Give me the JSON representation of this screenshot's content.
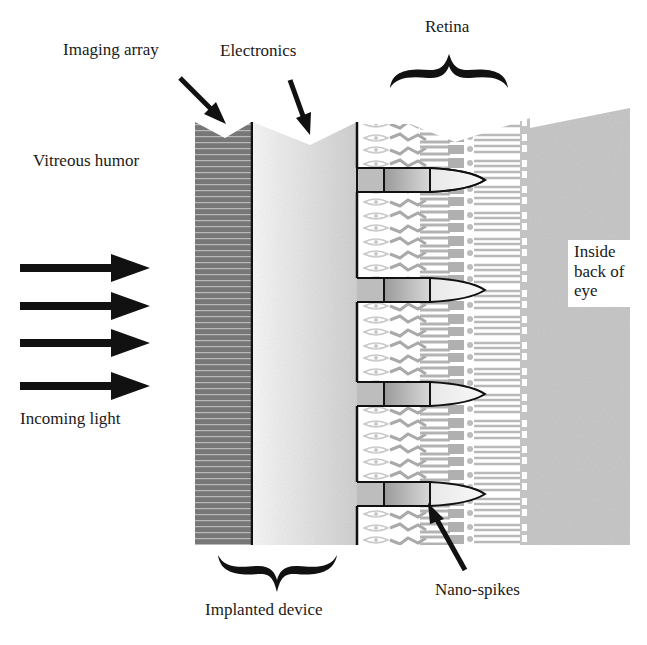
{
  "diagram": {
    "labels": {
      "imaging_array": "Imaging array",
      "electronics": "Electronics",
      "retina": "Retina",
      "vitreous_humor": "Vitreous humor",
      "incoming_light": "Incoming light",
      "inside_back_of_eye": "Inside back of eye",
      "implanted_device": "Implanted device",
      "nano_spikes": "Nano-spikes"
    },
    "light_arrows": 4,
    "nano_spike_count": 4,
    "colors": {
      "imaging_array": "#7a7a7a",
      "electronics_light": "#f2f2f2",
      "electronics_dark": "#cfcfcf",
      "retina_cells": "#b8b8b8",
      "back_of_eye": "#c4c4c4",
      "ink": "#111111"
    }
  }
}
